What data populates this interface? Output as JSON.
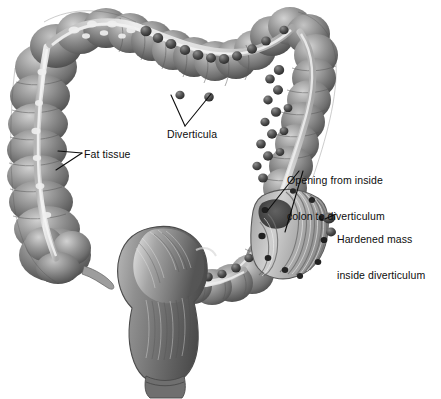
{
  "figure": {
    "background_color": "#ffffff",
    "width": 441,
    "height": 399,
    "style": "grayscale medical airbrush illustration",
    "palette": {
      "outline": "#3a3a3a",
      "colon_mid": "#8d8d8d",
      "colon_dark": "#5a5a5a",
      "colon_shadow": "#444444",
      "colon_light": "#c9c9c9",
      "taenia_band": "#dcdcdc",
      "taenia_highlight": "#f2f2f2",
      "diverticulum_nodule": "#4a4a4a",
      "nodule_dark": "#303030",
      "lumen_dark": "#2e2e2e",
      "mucosal_fold": "#b8b8b8",
      "rectum_mid": "#7f7f7f",
      "leader_line": "#101010",
      "label_text": "#0d0d0d"
    }
  },
  "labels": [
    {
      "id": "diverticula",
      "text": "Diverticula",
      "lines": [
        "Diverticula"
      ],
      "x": 167,
      "y": 128,
      "leader": "two-pronged V pointing up to dark nodules on transverse colon"
    },
    {
      "id": "fat_tissue",
      "text": "Fat tissue",
      "lines": [
        "Fat tissue"
      ],
      "x": 84,
      "y": 148,
      "leader": "two-pronged arrow pointing left to pale band on ascending colon"
    },
    {
      "id": "opening",
      "text": "Opening from inside colon to diverticulum",
      "lines": [
        "Opening from inside",
        "colon to diverticulum"
      ],
      "x": 287,
      "y": 150,
      "leader": "two lines descending into the cutaway lumen openings"
    },
    {
      "id": "hardened_mass",
      "text": "Hardened mass inside diverticulum",
      "lines": [
        "Hardened mass",
        "inside diverticulum"
      ],
      "x": 337,
      "y": 209,
      "leader": "short line pointing left to dark mass on sigmoid colon"
    }
  ],
  "anatomy": {
    "structures": [
      {
        "name": "ascending-colon",
        "description": "left vertical haustrated segment"
      },
      {
        "name": "hepatic-flexure",
        "description": "upper left bend"
      },
      {
        "name": "transverse-colon",
        "description": "upper horizontal haustrated segment with diverticula"
      },
      {
        "name": "splenic-flexure",
        "description": "upper right bend"
      },
      {
        "name": "descending-colon",
        "description": "right vertical segment, dense diverticula"
      },
      {
        "name": "sigmoid-colon",
        "description": "lower right curve with cutaway window"
      },
      {
        "name": "cecum",
        "description": "lower left rounded pouch"
      },
      {
        "name": "appendix",
        "description": "thin tail off the cecum"
      },
      {
        "name": "rectum",
        "description": "lower central smooth muscular segment"
      },
      {
        "name": "anal-canal",
        "description": "bottom taper"
      },
      {
        "name": "taenia-coli",
        "description": "pale longitudinal band carrying fat tissue"
      },
      {
        "name": "cutaway-window",
        "description": "opened sigmoid wall revealing mucosal folds and diverticular openings"
      }
    ]
  }
}
